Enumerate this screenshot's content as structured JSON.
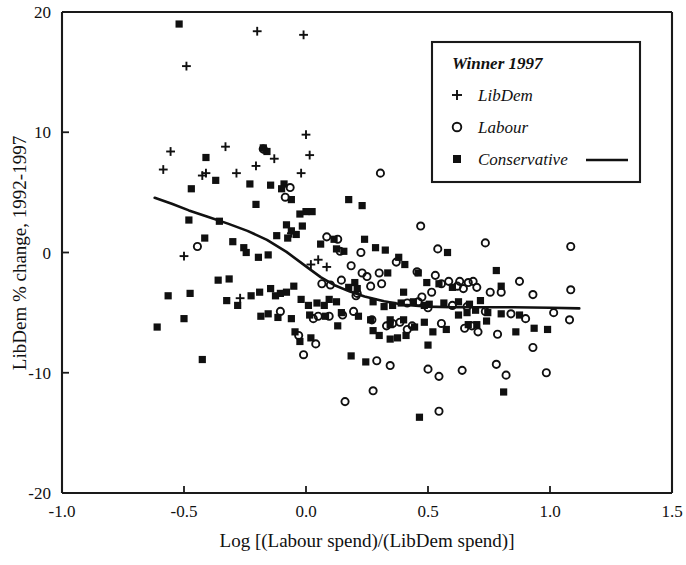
{
  "chart_data": {
    "type": "scatter",
    "title": "",
    "xlabel": "Log [(Labour spend)/(LibDem spend)]",
    "ylabel": "LibDem % change, 1992-1997",
    "xlim": [
      -1.0,
      1.5
    ],
    "ylim": [
      -20,
      20
    ],
    "xticks": [
      "-1.0",
      "-0.5",
      "0.0",
      "0.5",
      "1.0",
      "1.5"
    ],
    "xtick_values": [
      -1.0,
      -0.5,
      0.0,
      0.5,
      1.0,
      1.5
    ],
    "yticks": [
      "20",
      "10",
      "0",
      "-10",
      "-20"
    ],
    "ytick_values": [
      20,
      10,
      0,
      -10,
      -20
    ],
    "grid": false,
    "legend_position": "top-right",
    "legend": {
      "title": "Winner 1997",
      "entries": [
        {
          "label": "LibDem",
          "marker": "plus"
        },
        {
          "label": "Labour",
          "marker": "circle"
        },
        {
          "label": "Conservative",
          "marker": "square",
          "line": true
        }
      ]
    },
    "series": [
      {
        "name": "LibDem",
        "marker": "plus",
        "points": [
          [
            -0.49,
            15.5
          ],
          [
            -0.2,
            18.4
          ],
          [
            -0.01,
            18.1
          ],
          [
            -0.555,
            8.4
          ],
          [
            -0.585,
            6.9
          ],
          [
            -0.425,
            6.4
          ],
          [
            -0.41,
            6.6
          ],
          [
            -0.33,
            8.8
          ],
          [
            -0.285,
            6.6
          ],
          [
            -0.205,
            7.2
          ],
          [
            -0.175,
            8.6
          ],
          [
            -0.13,
            7.8
          ],
          [
            -0.02,
            6.6
          ],
          [
            0.0,
            9.8
          ],
          [
            0.015,
            8.1
          ],
          [
            -0.5,
            -0.3
          ],
          [
            -0.06,
            1.6
          ],
          [
            0.05,
            -0.6
          ],
          [
            0.085,
            -1.2
          ],
          [
            0.02,
            -1.0
          ],
          [
            -0.27,
            -3.8
          ]
        ]
      },
      {
        "name": "Labour",
        "marker": "circle",
        "points": [
          [
            -0.445,
            0.5
          ],
          [
            -0.175,
            8.6
          ],
          [
            -0.065,
            5.4
          ],
          [
            -0.085,
            4.6
          ],
          [
            0.085,
            1.3
          ],
          [
            0.13,
            1.1
          ],
          [
            0.14,
            0.1
          ],
          [
            0.225,
            0.0
          ],
          [
            0.305,
            6.6
          ],
          [
            0.47,
            2.2
          ],
          [
            0.54,
            0.3
          ],
          [
            0.735,
            0.8
          ],
          [
            1.085,
            0.5
          ],
          [
            0.37,
            -0.8
          ],
          [
            0.455,
            -1.6
          ],
          [
            0.53,
            -1.9
          ],
          [
            0.185,
            -1.1
          ],
          [
            0.23,
            -1.7
          ],
          [
            0.25,
            -2.0
          ],
          [
            0.3,
            -1.7
          ],
          [
            0.555,
            -2.6
          ],
          [
            0.585,
            -2.4
          ],
          [
            0.62,
            -2.8
          ],
          [
            0.63,
            -2.4
          ],
          [
            0.645,
            -3.0
          ],
          [
            0.665,
            -2.5
          ],
          [
            0.685,
            -2.4
          ],
          [
            0.7,
            -2.9
          ],
          [
            0.755,
            -3.3
          ],
          [
            0.8,
            -3.3
          ],
          [
            0.875,
            -2.4
          ],
          [
            0.93,
            -3.5
          ],
          [
            1.085,
            -3.1
          ],
          [
            0.065,
            -2.6
          ],
          [
            0.1,
            -2.7
          ],
          [
            0.205,
            -3.6
          ],
          [
            0.415,
            -4.2
          ],
          [
            0.46,
            -4.1
          ],
          [
            0.475,
            -3.7
          ],
          [
            0.5,
            -4.6
          ],
          [
            0.6,
            -4.4
          ],
          [
            0.66,
            -4.5
          ],
          [
            0.735,
            -4.9
          ],
          [
            0.84,
            -5.1
          ],
          [
            0.9,
            -5.5
          ],
          [
            1.015,
            -5.0
          ],
          [
            1.08,
            -5.6
          ],
          [
            0.03,
            -5.5
          ],
          [
            0.05,
            -5.3
          ],
          [
            0.095,
            -5.3
          ],
          [
            0.15,
            -5.2
          ],
          [
            0.195,
            -4.9
          ],
          [
            0.27,
            -5.6
          ],
          [
            0.33,
            -6.1
          ],
          [
            0.355,
            -5.9
          ],
          [
            0.385,
            -5.8
          ],
          [
            0.415,
            -6.4
          ],
          [
            0.435,
            -6.1
          ],
          [
            0.555,
            -5.9
          ],
          [
            0.65,
            -6.3
          ],
          [
            0.68,
            -6.1
          ],
          [
            0.705,
            -6.6
          ],
          [
            0.785,
            -6.8
          ],
          [
            -0.03,
            -6.9
          ],
          [
            -0.01,
            -8.5
          ],
          [
            0.04,
            -7.6
          ],
          [
            0.29,
            -9.0
          ],
          [
            0.345,
            -9.4
          ],
          [
            0.5,
            -9.7
          ],
          [
            0.545,
            -10.3
          ],
          [
            0.64,
            -9.8
          ],
          [
            0.78,
            -9.3
          ],
          [
            0.82,
            -10.2
          ],
          [
            0.985,
            -10.0
          ],
          [
            0.16,
            -12.4
          ],
          [
            0.275,
            -11.5
          ],
          [
            0.545,
            -13.2
          ],
          [
            0.93,
            -7.9
          ],
          [
            0.21,
            -3.4
          ],
          [
            0.265,
            -2.8
          ],
          [
            0.31,
            -2.6
          ],
          [
            0.145,
            -2.3
          ],
          [
            -0.105,
            -4.9
          ],
          [
            0.515,
            -3.3
          ]
        ]
      },
      {
        "name": "Conservative",
        "marker": "square",
        "points": [
          [
            -0.52,
            19.0
          ],
          [
            -0.41,
            7.9
          ],
          [
            -0.37,
            6.0
          ],
          [
            -0.23,
            5.7
          ],
          [
            -0.175,
            8.7
          ],
          [
            -0.16,
            8.4
          ],
          [
            -0.145,
            5.6
          ],
          [
            -0.09,
            5.7
          ],
          [
            -0.1,
            5.3
          ],
          [
            -0.06,
            4.4
          ],
          [
            0.0,
            3.4
          ],
          [
            -0.025,
            3.2
          ],
          [
            0.025,
            3.4
          ],
          [
            0.175,
            4.4
          ],
          [
            0.23,
            3.9
          ],
          [
            -0.205,
            4.0
          ],
          [
            -0.47,
            5.3
          ],
          [
            -0.48,
            2.7
          ],
          [
            -0.355,
            2.6
          ],
          [
            -0.415,
            1.2
          ],
          [
            -0.3,
            0.9
          ],
          [
            -0.255,
            0.4
          ],
          [
            -0.245,
            0.0
          ],
          [
            -0.195,
            -0.4
          ],
          [
            -0.155,
            -0.2
          ],
          [
            -0.36,
            -2.3
          ],
          [
            -0.315,
            -2.2
          ],
          [
            -0.12,
            1.4
          ],
          [
            -0.075,
            1.2
          ],
          [
            -0.08,
            2.3
          ],
          [
            -0.06,
            1.8
          ],
          [
            -0.04,
            1.5
          ],
          [
            -0.015,
            2.2
          ],
          [
            0.06,
            0.7
          ],
          [
            0.115,
            1.1
          ],
          [
            0.125,
            0.3
          ],
          [
            0.155,
            0.1
          ],
          [
            0.24,
            1.1
          ],
          [
            0.285,
            0.4
          ],
          [
            0.325,
            0.2
          ],
          [
            0.335,
            -1.7
          ],
          [
            0.38,
            -0.4
          ],
          [
            0.405,
            -1.0
          ],
          [
            0.46,
            -1.7
          ],
          [
            0.495,
            -2.5
          ],
          [
            0.545,
            -2.6
          ],
          [
            0.6,
            -2.9
          ],
          [
            0.625,
            -4.1
          ],
          [
            0.715,
            -4.0
          ],
          [
            0.78,
            -1.5
          ],
          [
            0.8,
            -2.8
          ],
          [
            0.58,
            0.0
          ],
          [
            0.4,
            -3.3
          ],
          [
            -0.565,
            -3.6
          ],
          [
            -0.475,
            -3.4
          ],
          [
            -0.5,
            -5.5
          ],
          [
            -0.61,
            -6.2
          ],
          [
            -0.425,
            -8.9
          ],
          [
            -0.325,
            -4.0
          ],
          [
            -0.28,
            -4.4
          ],
          [
            -0.225,
            -3.6
          ],
          [
            -0.19,
            -3.3
          ],
          [
            -0.145,
            -3.0
          ],
          [
            -0.125,
            -3.6
          ],
          [
            -0.105,
            -3.4
          ],
          [
            -0.08,
            -3.3
          ],
          [
            -0.05,
            -2.8
          ],
          [
            -0.02,
            -3.9
          ],
          [
            0.01,
            -4.4
          ],
          [
            0.045,
            -4.2
          ],
          [
            0.075,
            -4.4
          ],
          [
            0.095,
            -3.9
          ],
          [
            0.125,
            -4.1
          ],
          [
            0.175,
            -2.9
          ],
          [
            0.2,
            -2.5
          ],
          [
            0.21,
            -3.0
          ],
          [
            0.275,
            -4.1
          ],
          [
            0.32,
            -4.5
          ],
          [
            0.355,
            -4.4
          ],
          [
            0.39,
            -4.2
          ],
          [
            0.44,
            -4.1
          ],
          [
            0.485,
            -4.4
          ],
          [
            0.505,
            -4.3
          ],
          [
            0.565,
            -4.2
          ],
          [
            0.625,
            -5.2
          ],
          [
            0.67,
            -4.3
          ],
          [
            0.695,
            -4.8
          ],
          [
            0.745,
            -5.0
          ],
          [
            0.8,
            -5.1
          ],
          [
            0.875,
            -5.2
          ],
          [
            0.935,
            -6.3
          ],
          [
            0.99,
            -6.4
          ],
          [
            -0.185,
            -5.3
          ],
          [
            -0.155,
            -5.1
          ],
          [
            -0.115,
            -5.4
          ],
          [
            -0.06,
            -5.5
          ],
          [
            0.015,
            -5.2
          ],
          [
            0.08,
            -5.3
          ],
          [
            0.145,
            -5.0
          ],
          [
            0.215,
            -5.3
          ],
          [
            0.265,
            -5.6
          ],
          [
            0.345,
            -5.6
          ],
          [
            0.4,
            -5.6
          ],
          [
            0.445,
            -6.2
          ],
          [
            0.485,
            -5.8
          ],
          [
            0.52,
            -6.6
          ],
          [
            0.575,
            -6.4
          ],
          [
            0.665,
            -6.0
          ],
          [
            0.7,
            -6.0
          ],
          [
            0.74,
            -5.7
          ],
          [
            -0.045,
            -6.6
          ],
          [
            -0.025,
            -7.4
          ],
          [
            0.02,
            -7.1
          ],
          [
            0.275,
            -6.5
          ],
          [
            0.3,
            -6.9
          ],
          [
            0.345,
            -7.2
          ],
          [
            0.375,
            -7.1
          ],
          [
            0.41,
            -6.9
          ],
          [
            0.5,
            -7.7
          ],
          [
            0.185,
            -8.6
          ],
          [
            0.245,
            -9.1
          ],
          [
            0.81,
            -11.6
          ],
          [
            0.465,
            -13.7
          ],
          [
            0.66,
            -5.0
          ],
          [
            0.86,
            -6.6
          ],
          [
            0.345,
            -6.0
          ],
          [
            0.13,
            -6.1
          ]
        ]
      }
    ],
    "trend_line": {
      "name": "smoothed fit",
      "points": [
        [
          -0.62,
          4.55
        ],
        [
          -0.55,
          4.05
        ],
        [
          -0.48,
          3.5
        ],
        [
          -0.4,
          2.95
        ],
        [
          -0.32,
          2.4
        ],
        [
          -0.24,
          1.8
        ],
        [
          -0.16,
          1.05
        ],
        [
          -0.08,
          0.05
        ],
        [
          0.0,
          -1.15
        ],
        [
          0.06,
          -2.05
        ],
        [
          0.12,
          -2.75
        ],
        [
          0.18,
          -3.25
        ],
        [
          0.24,
          -3.65
        ],
        [
          0.32,
          -4.05
        ],
        [
          0.4,
          -4.35
        ],
        [
          0.5,
          -4.5
        ],
        [
          0.6,
          -4.55
        ],
        [
          0.72,
          -4.55
        ],
        [
          0.85,
          -4.55
        ],
        [
          1.0,
          -4.6
        ],
        [
          1.12,
          -4.65
        ]
      ]
    }
  }
}
